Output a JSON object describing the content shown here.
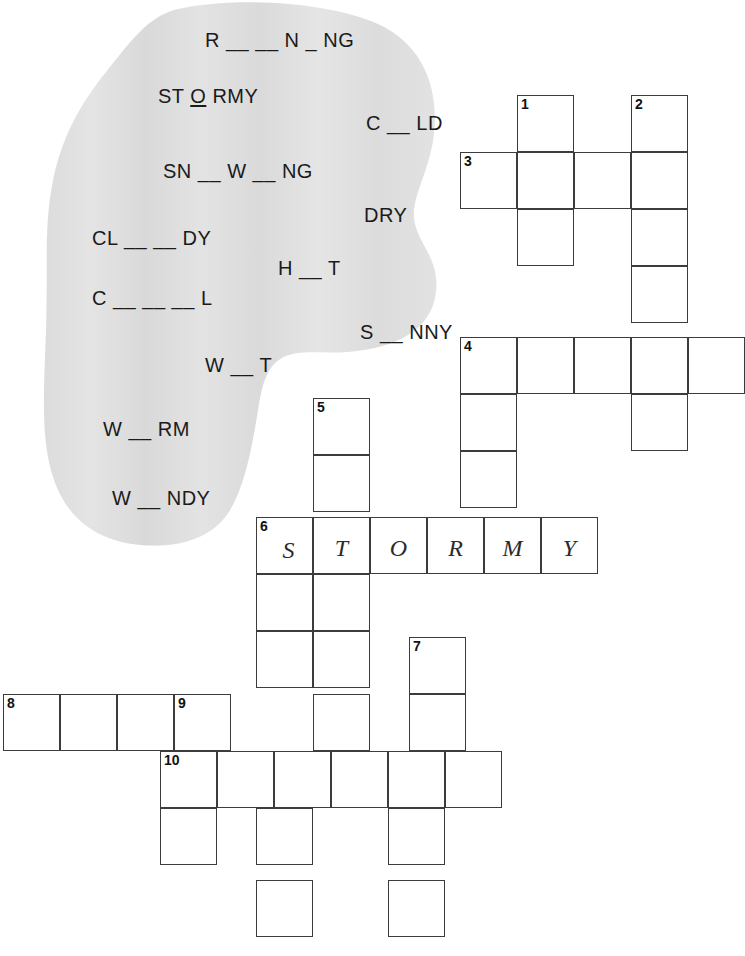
{
  "worksheet": {
    "type": "crossword-puzzle-worksheet",
    "topic": "weather"
  },
  "word_bank": {
    "name": "weather-word-bank",
    "background_color": "#e0e0e0",
    "words": [
      {
        "id": "w1",
        "text": "R ___ N _ NG",
        "display": "R __ __ N _ NG",
        "answer_hint": "RAINING",
        "x": 175,
        "y": 30
      },
      {
        "id": "w2",
        "text": "ST O RMY",
        "display": "ST O RMY",
        "answer_hint": "STORMY",
        "x": 128,
        "y": 86
      },
      {
        "id": "w3",
        "text": "C __ LD",
        "display": "C __ LD",
        "answer_hint": "COLD",
        "x": 336,
        "y": 113
      },
      {
        "id": "w4",
        "text": "SN __ W __ NG",
        "display": "SN __ W __ NG",
        "answer_hint": "SNOWING",
        "x": 133,
        "y": 161
      },
      {
        "id": "w5",
        "text": "DRY",
        "display": "DRY",
        "answer_hint": "DRY",
        "x": 334,
        "y": 205
      },
      {
        "id": "w6",
        "text": "CL ___ DY",
        "display": "CL __ __ DY",
        "answer_hint": "CLOUDY",
        "x": 62,
        "y": 228
      },
      {
        "id": "w7",
        "text": "H __ T",
        "display": "H __ T",
        "answer_hint": "HOT",
        "x": 248,
        "y": 258
      },
      {
        "id": "w8",
        "text": "C ____ L",
        "display": "C __ __ __ L",
        "answer_hint": "COOL",
        "x": 62,
        "y": 288
      },
      {
        "id": "w9",
        "text": "S __ NNY",
        "display": "S __ NNY",
        "answer_hint": "SUNNY",
        "x": 330,
        "y": 322
      },
      {
        "id": "w10",
        "text": "W __ T",
        "display": "W __ T",
        "answer_hint": "WET",
        "x": 175,
        "y": 355
      },
      {
        "id": "w11",
        "text": "W __ RM",
        "display": "W __ RM",
        "answer_hint": "WARM",
        "x": 73,
        "y": 419
      },
      {
        "id": "w12",
        "text": "W __ NDY",
        "display": "W __ NDY",
        "answer_hint": "WINDY",
        "x": 82,
        "y": 488
      }
    ]
  },
  "grid": {
    "cell_size": 57,
    "border_color": "#3c3c3c",
    "cells": [
      {
        "id": "c1",
        "x": 517,
        "y": 95,
        "num": "1",
        "letter": ""
      },
      {
        "id": "c2",
        "x": 631,
        "y": 95,
        "num": "2",
        "letter": ""
      },
      {
        "id": "c3",
        "x": 460,
        "y": 152,
        "num": "3",
        "letter": ""
      },
      {
        "id": "c4",
        "x": 517,
        "y": 152,
        "num": "",
        "letter": ""
      },
      {
        "id": "c5",
        "x": 574,
        "y": 152,
        "num": "",
        "letter": ""
      },
      {
        "id": "c6",
        "x": 631,
        "y": 152,
        "num": "",
        "letter": ""
      },
      {
        "id": "c7",
        "x": 517,
        "y": 209,
        "num": "",
        "letter": ""
      },
      {
        "id": "c8",
        "x": 631,
        "y": 209,
        "num": "",
        "letter": ""
      },
      {
        "id": "c9",
        "x": 631,
        "y": 266,
        "num": "",
        "letter": ""
      },
      {
        "id": "c10",
        "x": 460,
        "y": 337,
        "num": "4",
        "letter": ""
      },
      {
        "id": "c11",
        "x": 517,
        "y": 337,
        "num": "",
        "letter": ""
      },
      {
        "id": "c12",
        "x": 574,
        "y": 337,
        "num": "",
        "letter": ""
      },
      {
        "id": "c13",
        "x": 631,
        "y": 337,
        "num": "",
        "letter": ""
      },
      {
        "id": "c14",
        "x": 688,
        "y": 337,
        "num": "",
        "letter": ""
      },
      {
        "id": "c15",
        "x": 460,
        "y": 394,
        "num": "",
        "letter": ""
      },
      {
        "id": "c16",
        "x": 631,
        "y": 394,
        "num": "",
        "letter": ""
      },
      {
        "id": "c17",
        "x": 313,
        "y": 398,
        "num": "5",
        "letter": ""
      },
      {
        "id": "c18",
        "x": 313,
        "y": 455,
        "num": "",
        "letter": ""
      },
      {
        "id": "c19",
        "x": 460,
        "y": 451,
        "num": "",
        "letter": ""
      },
      {
        "id": "c20",
        "x": 256,
        "y": 517,
        "num": "6",
        "letter": "S"
      },
      {
        "id": "c21",
        "x": 313,
        "y": 517,
        "num": "",
        "letter": "T"
      },
      {
        "id": "c22",
        "x": 370,
        "y": 517,
        "num": "",
        "letter": "O"
      },
      {
        "id": "c23",
        "x": 427,
        "y": 517,
        "num": "",
        "letter": "R"
      },
      {
        "id": "c24",
        "x": 484,
        "y": 517,
        "num": "",
        "letter": "M"
      },
      {
        "id": "c25",
        "x": 541,
        "y": 517,
        "num": "",
        "letter": "Y"
      },
      {
        "id": "c26",
        "x": 256,
        "y": 574,
        "num": "",
        "letter": ""
      },
      {
        "id": "c27",
        "x": 313,
        "y": 574,
        "num": "",
        "letter": ""
      },
      {
        "id": "c28",
        "x": 256,
        "y": 631,
        "num": "",
        "letter": ""
      },
      {
        "id": "c29",
        "x": 313,
        "y": 631,
        "num": "",
        "letter": ""
      },
      {
        "id": "c30",
        "x": 409,
        "y": 637,
        "num": "7",
        "letter": ""
      },
      {
        "id": "c31",
        "x": 409,
        "y": 694,
        "num": "",
        "letter": ""
      },
      {
        "id": "c32",
        "x": 3,
        "y": 694,
        "num": "8",
        "letter": ""
      },
      {
        "id": "c33",
        "x": 60,
        "y": 694,
        "num": "",
        "letter": ""
      },
      {
        "id": "c34",
        "x": 117,
        "y": 694,
        "num": "",
        "letter": ""
      },
      {
        "id": "c35",
        "x": 174,
        "y": 694,
        "num": "9",
        "letter": ""
      },
      {
        "id": "c36",
        "x": 313,
        "y": 694,
        "num": "",
        "letter": ""
      },
      {
        "id": "c37",
        "x": 160,
        "y": 751,
        "num": "10",
        "letter": ""
      },
      {
        "id": "c38",
        "x": 217,
        "y": 751,
        "num": "",
        "letter": ""
      },
      {
        "id": "c39",
        "x": 274,
        "y": 751,
        "num": "",
        "letter": ""
      },
      {
        "id": "c40",
        "x": 331,
        "y": 751,
        "num": "",
        "letter": ""
      },
      {
        "id": "c41",
        "x": 388,
        "y": 751,
        "num": "",
        "letter": ""
      },
      {
        "id": "c42",
        "x": 445,
        "y": 751,
        "num": "",
        "letter": ""
      },
      {
        "id": "c43",
        "x": 160,
        "y": 808,
        "num": "",
        "letter": ""
      },
      {
        "id": "c44",
        "x": 256,
        "y": 808,
        "num": "",
        "letter": ""
      },
      {
        "id": "c45",
        "x": 388,
        "y": 808,
        "num": "",
        "letter": ""
      },
      {
        "id": "c46",
        "x": 256,
        "y": 880,
        "num": "",
        "letter": ""
      },
      {
        "id": "c47",
        "x": 388,
        "y": 880,
        "num": "",
        "letter": ""
      }
    ]
  }
}
